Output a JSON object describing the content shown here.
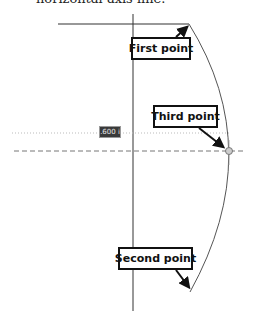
{
  "caption": "horizontal axis line.",
  "measurement": {
    "value": "1.600 in"
  },
  "callouts": {
    "first": "First point",
    "second": "Second point",
    "third": "Third point"
  },
  "colors": {
    "line": "#222222",
    "arc": "#555555",
    "guide": "#aaaaaa",
    "endpoint": "#bbbbbb"
  }
}
